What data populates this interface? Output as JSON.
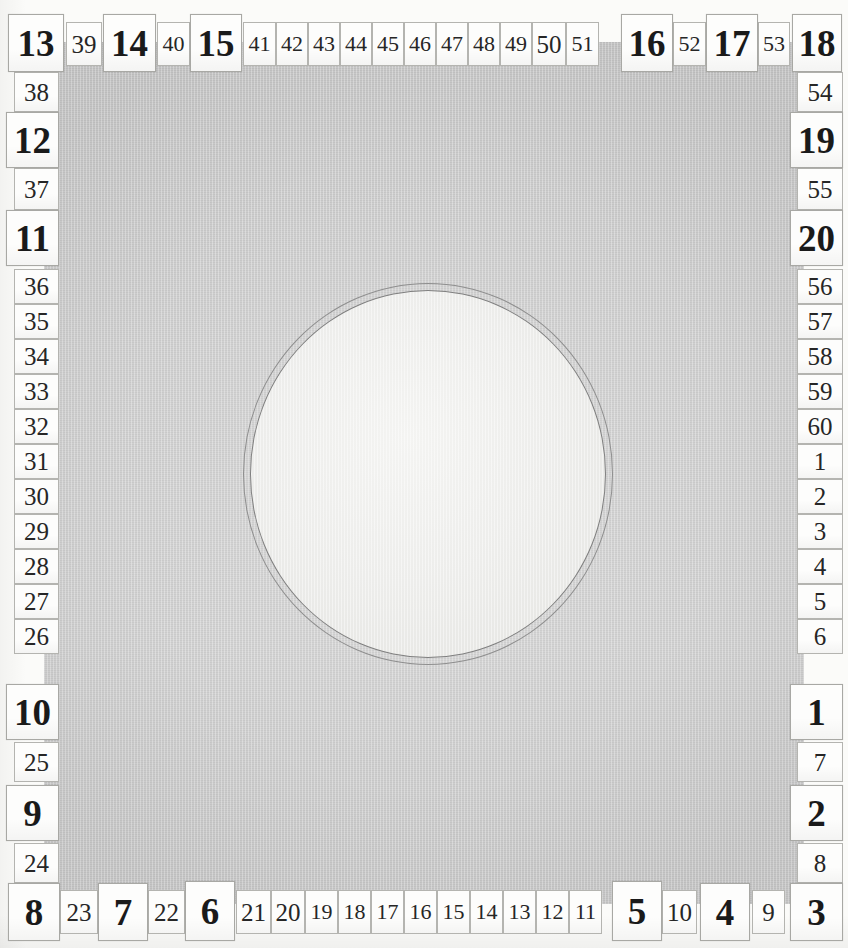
{
  "instrument": {
    "name": "circular-graduated-scale-plate",
    "major_divisions": 20,
    "minor_divisions": 60,
    "plate_color": "#c9c9c9",
    "label_color": "#1a1a1a",
    "label_background": "#fdfdfc",
    "dial_fill": "#ededeb",
    "dial_ring_color": "#8e8e8e"
  },
  "dial": {
    "shape": "double-ring-circle",
    "ring_count": 2
  },
  "ticks": {
    "top": [
      {
        "value": "13",
        "kind": "major",
        "x": 8,
        "y": 14,
        "w": 56,
        "h": 58
      },
      {
        "value": "39",
        "kind": "minor",
        "x": 66,
        "y": 22,
        "w": 36,
        "h": 44
      },
      {
        "value": "14",
        "kind": "major",
        "x": 103,
        "y": 14,
        "w": 53,
        "h": 58
      },
      {
        "value": "40",
        "kind": "minor",
        "x": 157,
        "y": 22,
        "w": 33,
        "h": 44
      },
      {
        "value": "15",
        "kind": "major",
        "x": 190,
        "y": 14,
        "w": 52,
        "h": 58
      },
      {
        "value": "41",
        "kind": "minor",
        "x": 243,
        "y": 22,
        "w": 33,
        "h": 44
      },
      {
        "value": "42",
        "kind": "minor",
        "x": 276,
        "y": 22,
        "w": 32,
        "h": 44
      },
      {
        "value": "43",
        "kind": "minor",
        "x": 308,
        "y": 22,
        "w": 32,
        "h": 44
      },
      {
        "value": "44",
        "kind": "minor",
        "x": 340,
        "y": 22,
        "w": 32,
        "h": 44
      },
      {
        "value": "45",
        "kind": "minor",
        "x": 372,
        "y": 22,
        "w": 32,
        "h": 44
      },
      {
        "value": "46",
        "kind": "minor",
        "x": 404,
        "y": 22,
        "w": 32,
        "h": 44
      },
      {
        "value": "47",
        "kind": "minor",
        "x": 436,
        "y": 22,
        "w": 32,
        "h": 44
      },
      {
        "value": "48",
        "kind": "minor",
        "x": 468,
        "y": 22,
        "w": 32,
        "h": 44
      },
      {
        "value": "49",
        "kind": "minor",
        "x": 500,
        "y": 22,
        "w": 32,
        "h": 44
      },
      {
        "value": "50",
        "kind": "minor",
        "x": 532,
        "y": 22,
        "w": 34,
        "h": 44
      },
      {
        "value": "51",
        "kind": "minor",
        "x": 566,
        "y": 22,
        "w": 33,
        "h": 44
      },
      {
        "value": "16",
        "kind": "major",
        "x": 621,
        "y": 14,
        "w": 52,
        "h": 58
      },
      {
        "value": "52",
        "kind": "minor",
        "x": 673,
        "y": 22,
        "w": 33,
        "h": 44
      },
      {
        "value": "17",
        "kind": "major",
        "x": 706,
        "y": 14,
        "w": 52,
        "h": 58
      },
      {
        "value": "53",
        "kind": "minor",
        "x": 758,
        "y": 22,
        "w": 32,
        "h": 44
      },
      {
        "value": "18",
        "kind": "major",
        "x": 792,
        "y": 14,
        "w": 50,
        "h": 58
      }
    ],
    "right": [
      {
        "value": "54",
        "kind": "minor",
        "x": 797,
        "y": 72,
        "w": 46,
        "h": 40
      },
      {
        "value": "19",
        "kind": "major",
        "x": 790,
        "y": 112,
        "w": 53,
        "h": 56
      },
      {
        "value": "55",
        "kind": "minor",
        "x": 797,
        "y": 168,
        "w": 46,
        "h": 42
      },
      {
        "value": "20",
        "kind": "major",
        "x": 790,
        "y": 210,
        "w": 53,
        "h": 56
      },
      {
        "value": "56",
        "kind": "minor",
        "x": 797,
        "y": 269,
        "w": 46,
        "h": 35
      },
      {
        "value": "57",
        "kind": "minor",
        "x": 797,
        "y": 304,
        "w": 46,
        "h": 35
      },
      {
        "value": "58",
        "kind": "minor",
        "x": 797,
        "y": 339,
        "w": 46,
        "h": 35
      },
      {
        "value": "59",
        "kind": "minor",
        "x": 797,
        "y": 374,
        "w": 46,
        "h": 35
      },
      {
        "value": "60",
        "kind": "minor",
        "x": 797,
        "y": 409,
        "w": 46,
        "h": 35
      },
      {
        "value": "1",
        "kind": "minor",
        "x": 797,
        "y": 444,
        "w": 46,
        "h": 35
      },
      {
        "value": "2",
        "kind": "minor",
        "x": 797,
        "y": 479,
        "w": 46,
        "h": 35
      },
      {
        "value": "3",
        "kind": "minor",
        "x": 797,
        "y": 514,
        "w": 46,
        "h": 35
      },
      {
        "value": "4",
        "kind": "minor",
        "x": 797,
        "y": 549,
        "w": 46,
        "h": 35
      },
      {
        "value": "5",
        "kind": "minor",
        "x": 797,
        "y": 584,
        "w": 46,
        "h": 35
      },
      {
        "value": "6",
        "kind": "minor",
        "x": 797,
        "y": 619,
        "w": 46,
        "h": 35
      },
      {
        "value": "1",
        "kind": "major",
        "x": 790,
        "y": 684,
        "w": 53,
        "h": 56
      },
      {
        "value": "7",
        "kind": "minor",
        "x": 797,
        "y": 742,
        "w": 46,
        "h": 40
      },
      {
        "value": "2",
        "kind": "major",
        "x": 790,
        "y": 785,
        "w": 53,
        "h": 56
      },
      {
        "value": "8",
        "kind": "minor",
        "x": 797,
        "y": 843,
        "w": 46,
        "h": 40
      },
      {
        "value": "3",
        "kind": "major",
        "x": 790,
        "y": 883,
        "w": 53,
        "h": 58
      }
    ],
    "bottom": [
      {
        "value": "8",
        "kind": "major",
        "x": 8,
        "y": 883,
        "w": 52,
        "h": 58
      },
      {
        "value": "23",
        "kind": "minor",
        "x": 60,
        "y": 890,
        "w": 38,
        "h": 44
      },
      {
        "value": "7",
        "kind": "major",
        "x": 98,
        "y": 883,
        "w": 50,
        "h": 58
      },
      {
        "value": "22",
        "kind": "minor",
        "x": 148,
        "y": 890,
        "w": 37,
        "h": 44
      },
      {
        "value": "6",
        "kind": "major",
        "x": 185,
        "y": 881,
        "w": 50,
        "h": 60
      },
      {
        "value": "21",
        "kind": "minor",
        "x": 236,
        "y": 890,
        "w": 35,
        "h": 44
      },
      {
        "value": "20",
        "kind": "minor",
        "x": 271,
        "y": 890,
        "w": 34,
        "h": 44
      },
      {
        "value": "19",
        "kind": "minor",
        "x": 305,
        "y": 890,
        "w": 33,
        "h": 44
      },
      {
        "value": "18",
        "kind": "minor",
        "x": 338,
        "y": 890,
        "w": 33,
        "h": 44
      },
      {
        "value": "17",
        "kind": "minor",
        "x": 371,
        "y": 890,
        "w": 33,
        "h": 44
      },
      {
        "value": "16",
        "kind": "minor",
        "x": 404,
        "y": 890,
        "w": 33,
        "h": 44
      },
      {
        "value": "15",
        "kind": "minor",
        "x": 437,
        "y": 890,
        "w": 33,
        "h": 44
      },
      {
        "value": "14",
        "kind": "minor",
        "x": 470,
        "y": 890,
        "w": 33,
        "h": 44
      },
      {
        "value": "13",
        "kind": "minor",
        "x": 503,
        "y": 890,
        "w": 33,
        "h": 44
      },
      {
        "value": "12",
        "kind": "minor",
        "x": 536,
        "y": 890,
        "w": 33,
        "h": 44
      },
      {
        "value": "11",
        "kind": "minor",
        "x": 569,
        "y": 890,
        "w": 33,
        "h": 44
      },
      {
        "value": "5",
        "kind": "major",
        "x": 612,
        "y": 881,
        "w": 50,
        "h": 60
      },
      {
        "value": "10",
        "kind": "minor",
        "x": 662,
        "y": 890,
        "w": 35,
        "h": 44
      },
      {
        "value": "4",
        "kind": "major",
        "x": 700,
        "y": 883,
        "w": 50,
        "h": 58
      },
      {
        "value": "9",
        "kind": "minor",
        "x": 752,
        "y": 890,
        "w": 33,
        "h": 44
      }
    ],
    "left": [
      {
        "value": "38",
        "kind": "minor",
        "x": 14,
        "y": 72,
        "w": 45,
        "h": 40
      },
      {
        "value": "12",
        "kind": "major",
        "x": 6,
        "y": 112,
        "w": 53,
        "h": 56
      },
      {
        "value": "37",
        "kind": "minor",
        "x": 14,
        "y": 168,
        "w": 45,
        "h": 42
      },
      {
        "value": "11",
        "kind": "major",
        "x": 6,
        "y": 210,
        "w": 53,
        "h": 56
      },
      {
        "value": "36",
        "kind": "minor",
        "x": 14,
        "y": 269,
        "w": 45,
        "h": 35
      },
      {
        "value": "35",
        "kind": "minor",
        "x": 14,
        "y": 304,
        "w": 45,
        "h": 35
      },
      {
        "value": "34",
        "kind": "minor",
        "x": 14,
        "y": 339,
        "w": 45,
        "h": 35
      },
      {
        "value": "33",
        "kind": "minor",
        "x": 14,
        "y": 374,
        "w": 45,
        "h": 35
      },
      {
        "value": "32",
        "kind": "minor",
        "x": 14,
        "y": 409,
        "w": 45,
        "h": 35
      },
      {
        "value": "31",
        "kind": "minor",
        "x": 14,
        "y": 444,
        "w": 45,
        "h": 35
      },
      {
        "value": "30",
        "kind": "minor",
        "x": 14,
        "y": 479,
        "w": 45,
        "h": 35
      },
      {
        "value": "29",
        "kind": "minor",
        "x": 14,
        "y": 514,
        "w": 45,
        "h": 35
      },
      {
        "value": "28",
        "kind": "minor",
        "x": 14,
        "y": 549,
        "w": 45,
        "h": 35
      },
      {
        "value": "27",
        "kind": "minor",
        "x": 14,
        "y": 584,
        "w": 45,
        "h": 35
      },
      {
        "value": "26",
        "kind": "minor",
        "x": 14,
        "y": 619,
        "w": 45,
        "h": 35
      },
      {
        "value": "10",
        "kind": "major",
        "x": 6,
        "y": 684,
        "w": 53,
        "h": 56
      },
      {
        "value": "25",
        "kind": "minor",
        "x": 14,
        "y": 742,
        "w": 45,
        "h": 40
      },
      {
        "value": "9",
        "kind": "major",
        "x": 6,
        "y": 785,
        "w": 53,
        "h": 56
      },
      {
        "value": "24",
        "kind": "minor",
        "x": 14,
        "y": 843,
        "w": 45,
        "h": 40
      }
    ]
  }
}
